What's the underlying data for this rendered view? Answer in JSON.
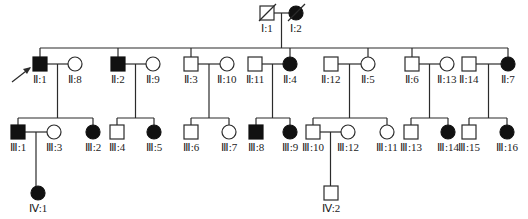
{
  "legend_semantics": {
    "square": "male",
    "circle": "female",
    "filled": "affected",
    "open": "unaffected",
    "slash": "deceased",
    "arrow": "proband"
  },
  "colors": {
    "line": "#2b2b2b",
    "affected": "#111111",
    "unaffected": "#ffffff"
  },
  "individuals": [
    {
      "id": "I:1",
      "label": "Ⅰ:1",
      "sex": "male",
      "affected": false,
      "deceased": true
    },
    {
      "id": "I:2",
      "label": "Ⅰ:2",
      "sex": "female",
      "affected": true,
      "deceased": true
    },
    {
      "id": "II:1",
      "label": "Ⅱ:1",
      "sex": "male",
      "affected": true,
      "proband": true
    },
    {
      "id": "II:8",
      "label": "Ⅱ:8",
      "sex": "female",
      "affected": false
    },
    {
      "id": "II:2",
      "label": "Ⅱ:2",
      "sex": "male",
      "affected": true
    },
    {
      "id": "II:9",
      "label": "Ⅱ:9",
      "sex": "female",
      "affected": false
    },
    {
      "id": "II:3",
      "label": "Ⅱ:3",
      "sex": "male",
      "affected": false
    },
    {
      "id": "II:10",
      "label": "Ⅱ:10",
      "sex": "female",
      "affected": false
    },
    {
      "id": "II:11",
      "label": "Ⅱ:11",
      "sex": "male",
      "affected": false
    },
    {
      "id": "II:4",
      "label": "Ⅱ:4",
      "sex": "female",
      "affected": true
    },
    {
      "id": "II:12",
      "label": "Ⅱ:12",
      "sex": "male",
      "affected": false
    },
    {
      "id": "II:5",
      "label": "Ⅱ:5",
      "sex": "female",
      "affected": false
    },
    {
      "id": "II:6",
      "label": "Ⅱ:6",
      "sex": "male",
      "affected": false
    },
    {
      "id": "II:13",
      "label": "Ⅱ:13",
      "sex": "female",
      "affected": false
    },
    {
      "id": "II:14",
      "label": "Ⅱ:14",
      "sex": "male",
      "affected": false
    },
    {
      "id": "II:7",
      "label": "Ⅱ:7",
      "sex": "female",
      "affected": true
    },
    {
      "id": "III:1",
      "label": "Ⅲ:1",
      "sex": "male",
      "affected": true
    },
    {
      "id": "III:3",
      "label": "Ⅲ:3",
      "sex": "female",
      "affected": false
    },
    {
      "id": "III:2",
      "label": "Ⅲ:2",
      "sex": "female",
      "affected": true
    },
    {
      "id": "III:4",
      "label": "Ⅲ:4",
      "sex": "male",
      "affected": false
    },
    {
      "id": "III:5",
      "label": "Ⅲ:5",
      "sex": "female",
      "affected": true
    },
    {
      "id": "III:6",
      "label": "Ⅲ:6",
      "sex": "male",
      "affected": false
    },
    {
      "id": "III:7",
      "label": "Ⅲ:7",
      "sex": "female",
      "affected": false
    },
    {
      "id": "III:8",
      "label": "Ⅲ:8",
      "sex": "male",
      "affected": true
    },
    {
      "id": "III:9",
      "label": "Ⅲ:9",
      "sex": "female",
      "affected": true
    },
    {
      "id": "III:10",
      "label": "Ⅲ:10",
      "sex": "male",
      "affected": false
    },
    {
      "id": "III:12",
      "label": "Ⅲ:12",
      "sex": "female",
      "affected": false
    },
    {
      "id": "III:11",
      "label": "Ⅲ:11",
      "sex": "female",
      "affected": false
    },
    {
      "id": "III:13",
      "label": "Ⅲ:13",
      "sex": "male",
      "affected": false
    },
    {
      "id": "III:14",
      "label": "Ⅲ:14",
      "sex": "female",
      "affected": true
    },
    {
      "id": "III:15",
      "label": "Ⅲ:15",
      "sex": "male",
      "affected": false
    },
    {
      "id": "III:16",
      "label": "Ⅲ:16",
      "sex": "female",
      "affected": true
    },
    {
      "id": "IV:1",
      "label": "Ⅳ:1",
      "sex": "female",
      "affected": true
    },
    {
      "id": "IV:2",
      "label": "Ⅳ:2",
      "sex": "male",
      "affected": false
    }
  ],
  "unions": [
    {
      "partners": [
        "I:1",
        "I:2"
      ],
      "children": [
        "II:1",
        "II:2",
        "II:3",
        "II:4",
        "II:5",
        "II:6",
        "II:7"
      ]
    },
    {
      "partners": [
        "II:1",
        "II:8"
      ],
      "children": [
        "III:1",
        "III:2"
      ]
    },
    {
      "partners": [
        "II:2",
        "II:9"
      ],
      "children": [
        "III:4",
        "III:5"
      ]
    },
    {
      "partners": [
        "II:3",
        "II:10"
      ],
      "children": [
        "III:6",
        "III:7"
      ]
    },
    {
      "partners": [
        "II:11",
        "II:4"
      ],
      "children": [
        "III:8",
        "III:9"
      ]
    },
    {
      "partners": [
        "II:12",
        "II:5"
      ],
      "children": [
        "III:10",
        "III:11"
      ]
    },
    {
      "partners": [
        "II:6",
        "II:13"
      ],
      "children": [
        "III:13",
        "III:14"
      ]
    },
    {
      "partners": [
        "II:14",
        "II:7"
      ],
      "children": [
        "III:15",
        "III:16"
      ]
    },
    {
      "partners": [
        "III:1",
        "III:3"
      ],
      "children": [
        "IV:1"
      ]
    },
    {
      "partners": [
        "III:10",
        "III:12"
      ],
      "children": [
        "IV:2"
      ]
    }
  ]
}
